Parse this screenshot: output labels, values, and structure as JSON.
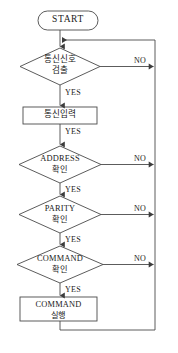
{
  "diagram": {
    "type": "flowchart",
    "orientation": "top-to-bottom",
    "stroke_color": "#4a4a4a",
    "text_color": "#1a1a1a",
    "background_color": "#ffffff",
    "nodes": [
      {
        "id": "start",
        "shape": "stadium",
        "label": "START"
      },
      {
        "id": "signal_detect",
        "shape": "diamond",
        "line1": "통신신호",
        "line2": "검출"
      },
      {
        "id": "signal_input",
        "shape": "rectangle",
        "label": "통신입력"
      },
      {
        "id": "address_check",
        "shape": "diamond",
        "line1": "ADDRESS",
        "line2": "확인"
      },
      {
        "id": "parity_check",
        "shape": "diamond",
        "line1": "PARITY",
        "line2": "확인"
      },
      {
        "id": "command_check",
        "shape": "diamond",
        "line1": "COMMAND",
        "line2": "확인"
      },
      {
        "id": "command_exec",
        "shape": "rectangle",
        "line1": "COMMAND",
        "line2": "실행"
      }
    ],
    "edge_labels": {
      "yes": "YES",
      "no": "NO"
    },
    "edges": [
      {
        "from": "start",
        "to": "signal_detect",
        "label": ""
      },
      {
        "from": "signal_detect",
        "to": "signal_input",
        "label": "YES"
      },
      {
        "from": "signal_detect",
        "to": "start_join",
        "label": "NO"
      },
      {
        "from": "signal_input",
        "to": "address_check",
        "label": "YES"
      },
      {
        "from": "address_check",
        "to": "parity_check",
        "label": "YES"
      },
      {
        "from": "address_check",
        "to": "start_join",
        "label": "NO"
      },
      {
        "from": "parity_check",
        "to": "command_check",
        "label": "YES"
      },
      {
        "from": "parity_check",
        "to": "start_join",
        "label": "NO"
      },
      {
        "from": "command_check",
        "to": "command_exec",
        "label": "YES"
      },
      {
        "from": "command_check",
        "to": "start_join",
        "label": "NO"
      },
      {
        "from": "command_exec",
        "to": "start_join",
        "label": ""
      }
    ]
  }
}
